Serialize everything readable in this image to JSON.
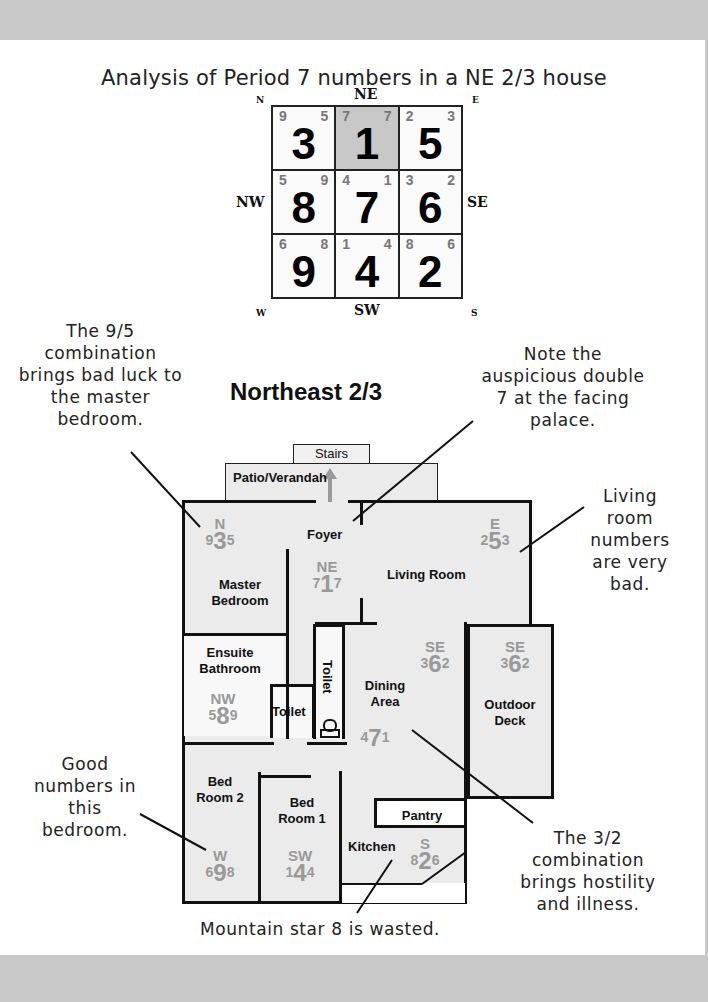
{
  "title": "Analysis of Period 7 numbers in a NE 2/3 house",
  "compass": {
    "N": "N",
    "NE": "NE",
    "E": "E",
    "NW": "NW",
    "SE": "SE",
    "W": "W",
    "SW": "SW",
    "S": "S"
  },
  "flying_star_chart": {
    "cells": [
      {
        "position": "N",
        "mountain": "9",
        "facing": "5",
        "base": "3",
        "highlight": false
      },
      {
        "position": "NE",
        "mountain": "7",
        "facing": "7",
        "base": "1",
        "highlight": true
      },
      {
        "position": "E",
        "mountain": "2",
        "facing": "3",
        "base": "5",
        "highlight": false
      },
      {
        "position": "NW",
        "mountain": "5",
        "facing": "9",
        "base": "8",
        "highlight": false
      },
      {
        "position": "Center",
        "mountain": "4",
        "facing": "1",
        "base": "7",
        "highlight": false
      },
      {
        "position": "SE",
        "mountain": "3",
        "facing": "2",
        "base": "6",
        "highlight": false
      },
      {
        "position": "W",
        "mountain": "6",
        "facing": "8",
        "base": "9",
        "highlight": false
      },
      {
        "position": "SW",
        "mountain": "1",
        "facing": "4",
        "base": "4",
        "highlight": false
      },
      {
        "position": "S",
        "mountain": "8",
        "facing": "6",
        "base": "2",
        "highlight": false
      }
    ]
  },
  "plan_title": "Northeast 2/3",
  "notes": {
    "nine_five": "The 9/5 combination brings bad luck to the master bedroom.",
    "double_seven": "Note the auspicious double 7 at the facing palace.",
    "living_room": "Living room numbers are very bad.",
    "good_bedroom": "Good numbers in this bedroom.",
    "three_two": "The 3/2 combination brings hostility and illness.",
    "mountain_eight": "Mountain star 8 is wasted."
  },
  "rooms": {
    "stairs": "Stairs",
    "patio": "Patio/Verandah",
    "foyer": "Foyer",
    "master_bedroom": "Master Bedroom",
    "living_room": "Living Room",
    "ensuite": "Ensuite Bathroom",
    "toilet1": "Toilet",
    "toilet2": "Toilet",
    "dining": "Dining Area",
    "outdoor_deck": "Outdoor Deck",
    "bed2": "Bed Room 2",
    "bed1": "Bed Room 1",
    "pantry": "Pantry",
    "kitchen": "Kitchen"
  },
  "room_stars": {
    "N": {
      "dir": "N",
      "m": "9",
      "b": "3",
      "f": "5"
    },
    "NE": {
      "dir": "NE",
      "m": "7",
      "b": "1",
      "f": "7"
    },
    "E": {
      "dir": "E",
      "m": "2",
      "b": "5",
      "f": "3"
    },
    "NW": {
      "dir": "NW",
      "m": "5",
      "b": "8",
      "f": "9"
    },
    "SE1": {
      "dir": "SE",
      "m": "3",
      "b": "6",
      "f": "2"
    },
    "SE2": {
      "dir": "SE",
      "m": "3",
      "b": "6",
      "f": "2"
    },
    "C": {
      "dir": "",
      "m": "4",
      "b": "7",
      "f": "1"
    },
    "W": {
      "dir": "W",
      "m": "6",
      "b": "9",
      "f": "8"
    },
    "SW": {
      "dir": "SW",
      "m": "1",
      "b": "4",
      "f": "4"
    },
    "S": {
      "dir": "S",
      "m": "8",
      "b": "2",
      "f": "6"
    }
  }
}
